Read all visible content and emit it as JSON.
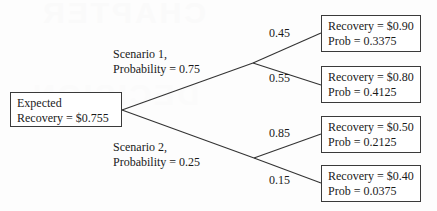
{
  "diagram": {
    "watermark_text": "CHAPTER",
    "watermark_text_2": "DECISION",
    "line_color": "#333333",
    "box_border_color": "#3a3a3a",
    "background_color": "#fdfdfd"
  },
  "root": {
    "line1": "Expected",
    "line2": "Recovery = $0.755"
  },
  "branches": [
    {
      "label_line1": "Scenario 1,",
      "label_line2": "Probability = 0.75",
      "probability": 0.75
    },
    {
      "label_line1": "Scenario 2,",
      "label_line2": "Probability = 0.25",
      "probability": 0.25
    }
  ],
  "edges": [
    {
      "label": "0.45",
      "value": 0.45
    },
    {
      "label": "0.55",
      "value": 0.55
    },
    {
      "label": "0.85",
      "value": 0.85
    },
    {
      "label": "0.15",
      "value": 0.15
    }
  ],
  "leaves": [
    {
      "line1": "Recovery = $0.90",
      "line2": "Prob = 0.3375",
      "recovery": 0.9,
      "prob": 0.3375
    },
    {
      "line1": "Recovery = $0.80",
      "line2": "Prob = 0.4125",
      "recovery": 0.8,
      "prob": 0.4125
    },
    {
      "line1": "Recovery = $0.50",
      "line2": "Prob = 0.2125",
      "recovery": 0.5,
      "prob": 0.2125
    },
    {
      "line1": "Recovery = $0.40",
      "line2": "Prob = 0.0375",
      "recovery": 0.4,
      "prob": 0.0375
    }
  ]
}
